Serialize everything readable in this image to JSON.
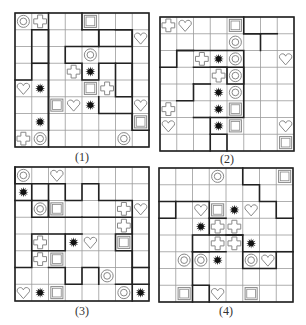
{
  "figure": {
    "grid_size": 8,
    "symbol_legend": {
      "ring": "double circle",
      "cross": "outlined plus/cross",
      "heart": "outlined heart",
      "square": "double-outlined square",
      "star": "black star/burst"
    },
    "colors": {
      "line": "#9a9a9a",
      "thick": "#222222",
      "symbol": "#888888",
      "star": "#111111"
    },
    "panels": [
      {
        "label": "(1)",
        "symbols": [
          [
            0,
            0,
            "ring"
          ],
          [
            0,
            1,
            "cross"
          ],
          [
            0,
            4,
            "square"
          ],
          [
            1,
            7,
            "heart"
          ],
          [
            2,
            4,
            "ring"
          ],
          [
            3,
            3,
            "cross"
          ],
          [
            3,
            4,
            "star"
          ],
          [
            4,
            0,
            "heart"
          ],
          [
            4,
            1,
            "star"
          ],
          [
            4,
            4,
            "square"
          ],
          [
            4,
            5,
            "cross"
          ],
          [
            5,
            2,
            "square"
          ],
          [
            5,
            3,
            "heart"
          ],
          [
            5,
            4,
            "star"
          ],
          [
            5,
            7,
            "heart"
          ],
          [
            6,
            1,
            "star"
          ],
          [
            6,
            7,
            "square"
          ],
          [
            7,
            0,
            "cross"
          ],
          [
            7,
            1,
            "ring"
          ],
          [
            7,
            6,
            "ring"
          ]
        ],
        "thick_paths": [
          [
            [
              1,
              1
            ],
            [
              1,
              2
            ],
            [
              7,
              2
            ]
          ],
          [
            [
              3,
              1
            ],
            [
              3,
              2
            ]
          ],
          [
            [
              1,
              1
            ],
            [
              4,
              1
            ],
            [
              4,
              0
            ]
          ],
          [
            [
              0,
              2
            ],
            [
              8,
              2
            ]
          ],
          [
            [
              2,
              3
            ],
            [
              2,
              5
            ],
            [
              1,
              5
            ],
            [
              1,
              7
            ],
            [
              5,
              7
            ],
            [
              5,
              6
            ],
            [
              3,
              6
            ],
            [
              3,
              5
            ],
            [
              4,
              5
            ],
            [
              4,
              4
            ],
            [
              3,
              4
            ],
            [
              3,
              3
            ],
            [
              2,
              3
            ]
          ],
          [
            [
              3,
              6
            ],
            [
              3,
              7
            ],
            [
              7,
              7
            ]
          ],
          [
            [
              6,
              7
            ],
            [
              7,
              7
            ],
            [
              7,
              8
            ]
          ],
          [
            [
              0,
              4
            ],
            [
              1,
              4
            ]
          ],
          [
            [
              1,
              4
            ],
            [
              1,
              5
            ],
            [
              2,
              5
            ],
            [
              2,
              6
            ],
            [
              2,
              7
            ],
            [
              1,
              7
            ],
            [
              1,
              6
            ]
          ],
          [
            [
              5,
              5
            ],
            [
              6,
              5
            ],
            [
              6,
              7
            ]
          ]
        ]
      },
      {
        "label": "(2)",
        "symbols": [
          [
            0,
            0,
            "cross"
          ],
          [
            0,
            1,
            "heart"
          ],
          [
            0,
            4,
            "square"
          ],
          [
            1,
            4,
            "ring"
          ],
          [
            2,
            2,
            "cross"
          ],
          [
            2,
            3,
            "star"
          ],
          [
            2,
            4,
            "ring"
          ],
          [
            2,
            7,
            "heart"
          ],
          [
            3,
            3,
            "cross"
          ],
          [
            3,
            4,
            "ring"
          ],
          [
            4,
            3,
            "star"
          ],
          [
            4,
            4,
            "ring"
          ],
          [
            5,
            0,
            "cross"
          ],
          [
            5,
            3,
            "star"
          ],
          [
            5,
            4,
            "square"
          ],
          [
            6,
            0,
            "heart"
          ],
          [
            6,
            3,
            "star"
          ],
          [
            6,
            4,
            "square"
          ],
          [
            6,
            7,
            "heart"
          ],
          [
            7,
            7,
            "square"
          ]
        ],
        "thick_paths": [
          [
            [
              3,
              0
            ],
            [
              3,
              1
            ],
            [
              2,
              1
            ],
            [
              2,
              5
            ],
            [
              4,
              5
            ],
            [
              4,
              4
            ],
            [
              3,
              4
            ],
            [
              3,
              3
            ]
          ],
          [
            [
              2,
              1
            ],
            [
              2,
              2
            ]
          ],
          [
            [
              3,
              2
            ],
            [
              3,
              5
            ],
            [
              6,
              5
            ],
            [
              6,
              3
            ],
            [
              8,
              3
            ]
          ],
          [
            [
              6,
              2
            ],
            [
              6,
              3
            ]
          ],
          [
            [
              1,
              5
            ],
            [
              1,
              6
            ],
            [
              2,
              6
            ]
          ],
          [
            [
              1,
              6
            ],
            [
              1,
              7
            ]
          ],
          [
            [
              4,
              2
            ],
            [
              4,
              3
            ]
          ],
          [
            [
              7,
              3
            ],
            [
              7,
              4
            ],
            [
              8,
              4
            ]
          ],
          [
            [
              5,
              1
            ],
            [
              5,
              2
            ],
            [
              4,
              2
            ]
          ],
          [
            [
              0,
              5
            ],
            [
              1,
              5
            ],
            [
              1,
              6
            ]
          ]
        ]
      },
      {
        "label": "(3)",
        "symbols": [
          [
            0,
            0,
            "ring"
          ],
          [
            0,
            2,
            "heart"
          ],
          [
            1,
            0,
            "star"
          ],
          [
            2,
            1,
            "ring"
          ],
          [
            2,
            2,
            "square"
          ],
          [
            2,
            6,
            "cross"
          ],
          [
            2,
            7,
            "heart"
          ],
          [
            3,
            6,
            "cross"
          ],
          [
            4,
            1,
            "cross"
          ],
          [
            4,
            3,
            "star"
          ],
          [
            4,
            4,
            "heart"
          ],
          [
            4,
            6,
            "square"
          ],
          [
            5,
            1,
            "cross"
          ],
          [
            5,
            2,
            "square"
          ],
          [
            6,
            5,
            "ring"
          ],
          [
            7,
            0,
            "heart"
          ],
          [
            7,
            1,
            "star"
          ],
          [
            7,
            2,
            "square"
          ],
          [
            7,
            6,
            "ring"
          ],
          [
            7,
            7,
            "star"
          ]
        ],
        "thick_paths": [
          [
            [
              2,
              0
            ],
            [
              2,
              1
            ]
          ],
          [
            [
              1,
              2
            ],
            [
              1,
              0
            ],
            [
              0,
              0
            ]
          ],
          [
            [
              2,
              1
            ],
            [
              2,
              2
            ],
            [
              3,
              2
            ],
            [
              3,
              1
            ],
            [
              1,
              1
            ]
          ],
          [
            [
              3,
              2
            ],
            [
              1,
              2
            ],
            [
              1,
              3
            ],
            [
              2,
              3
            ],
            [
              2,
              4
            ],
            [
              1,
              4
            ],
            [
              1,
              5
            ],
            [
              2,
              5
            ],
            [
              2,
              6
            ],
            [
              2,
              7
            ],
            [
              8,
              7
            ]
          ],
          [
            [
              3,
              2
            ],
            [
              3,
              4
            ]
          ],
          [
            [
              3,
              4
            ],
            [
              3,
              7
            ],
            [
              4,
              7
            ],
            [
              4,
              6
            ],
            [
              5,
              6
            ],
            [
              5,
              7
            ],
            [
              7,
              7
            ]
          ],
          [
            [
              4,
              1
            ],
            [
              4,
              3
            ],
            [
              5,
              3
            ],
            [
              5,
              1
            ],
            [
              4,
              1
            ]
          ],
          [
            [
              4,
              3
            ],
            [
              4,
              4
            ]
          ],
          [
            [
              5,
              1
            ],
            [
              6,
              1
            ],
            [
              6,
              0
            ]
          ],
          [
            [
              6,
              2
            ],
            [
              6,
              3
            ],
            [
              7,
              3
            ],
            [
              7,
              4
            ],
            [
              6,
              4
            ],
            [
              6,
              5
            ],
            [
              7,
              5
            ]
          ],
          [
            [
              6,
              7
            ],
            [
              6,
              8
            ]
          ],
          [
            [
              7,
              6
            ],
            [
              7,
              8
            ]
          ]
        ]
      },
      {
        "label": "(4)",
        "symbols": [
          [
            0,
            3,
            "ring"
          ],
          [
            0,
            7,
            "square"
          ],
          [
            2,
            2,
            "heart"
          ],
          [
            2,
            3,
            "square"
          ],
          [
            2,
            4,
            "star"
          ],
          [
            2,
            5,
            "heart"
          ],
          [
            3,
            2,
            "star"
          ],
          [
            3,
            3,
            "cross"
          ],
          [
            3,
            4,
            "cross"
          ],
          [
            4,
            3,
            "cross"
          ],
          [
            4,
            4,
            "cross"
          ],
          [
            4,
            5,
            "star"
          ],
          [
            5,
            1,
            "ring"
          ],
          [
            5,
            2,
            "ring"
          ],
          [
            5,
            3,
            "star"
          ],
          [
            5,
            5,
            "ring"
          ],
          [
            5,
            6,
            "heart"
          ],
          [
            7,
            1,
            "square"
          ],
          [
            7,
            3,
            "heart"
          ],
          [
            7,
            5,
            "square"
          ]
        ],
        "thick_paths": [
          [
            [
              0,
              5
            ],
            [
              1,
              5
            ],
            [
              1,
              6
            ],
            [
              2,
              6
            ],
            [
              2,
              7
            ],
            [
              3,
              7
            ],
            [
              3,
              8
            ]
          ],
          [
            [
              2,
              0
            ],
            [
              2,
              1
            ],
            [
              3,
              1
            ],
            [
              3,
              0
            ]
          ],
          [
            [
              2,
              1
            ],
            [
              2,
              3
            ],
            [
              4,
              3
            ],
            [
              4,
              5
            ],
            [
              5,
              5
            ],
            [
              5,
              7
            ],
            [
              6,
              7
            ],
            [
              6,
              5
            ],
            [
              5,
              5
            ]
          ],
          [
            [
              3,
              3
            ],
            [
              3,
              4
            ]
          ],
          [
            [
              4,
              3
            ],
            [
              4,
              2
            ],
            [
              5,
              2
            ],
            [
              5,
              3
            ]
          ],
          [
            [
              5,
              2
            ],
            [
              5,
              4
            ]
          ],
          [
            [
              4,
              4
            ],
            [
              4,
              5
            ]
          ],
          [
            [
              5,
              7
            ],
            [
              5,
              8
            ]
          ],
          [
            [
              5,
              2
            ],
            [
              7,
              2
            ],
            [
              7,
              3
            ],
            [
              8,
              3
            ]
          ],
          [
            [
              7,
              2
            ],
            [
              8,
              2
            ]
          ]
        ]
      }
    ]
  }
}
